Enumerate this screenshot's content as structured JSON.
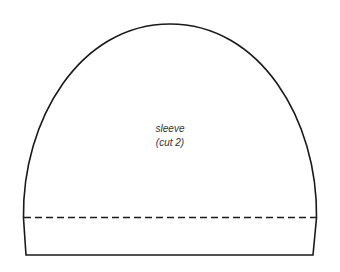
{
  "pattern_piece": {
    "name": "sleeve",
    "cut_instruction": "(cut 2)",
    "stroke_color": "#1a1a1a",
    "fold_line_style": "dashed"
  }
}
